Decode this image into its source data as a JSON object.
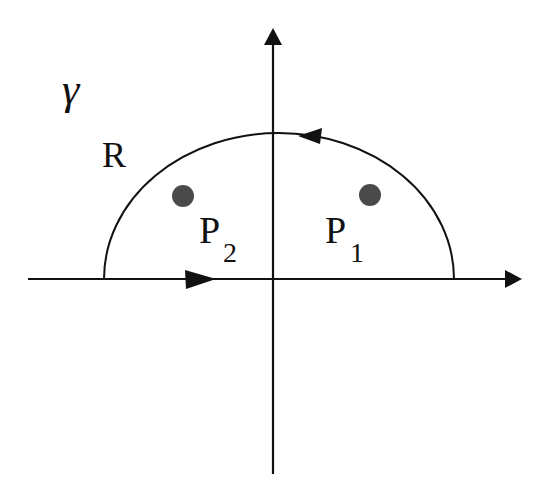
{
  "diagram": {
    "contour_label": {
      "symbol": "γ",
      "subscript": "R"
    },
    "poles": [
      {
        "label": "P",
        "subscript": "2",
        "position": "upper-left"
      },
      {
        "label": "P",
        "subscript": "1",
        "position": "upper-right"
      }
    ],
    "axes": {
      "horizontal": "real axis",
      "vertical": "imaginary axis"
    },
    "orientation": "counterclockwise",
    "colors": {
      "line": "#111111",
      "pole": "#4a4a4a",
      "background": "#ffffff"
    }
  }
}
